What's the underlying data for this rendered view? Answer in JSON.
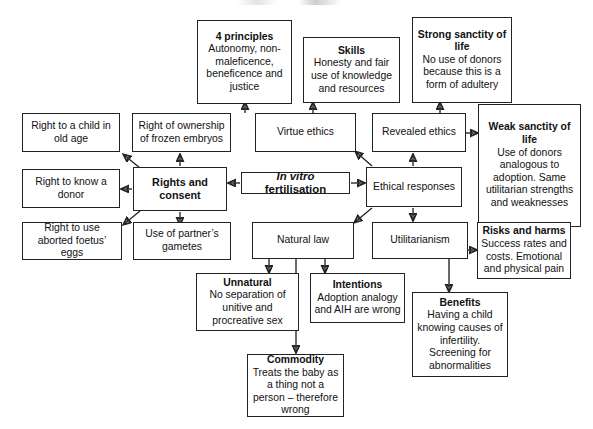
{
  "diagram": {
    "central_node": {
      "lead": "In vitro",
      "rest": " fertilisation"
    },
    "nodes": [
      {
        "id": "four-principles",
        "title": "4 principles",
        "body": "Autonomy, non-maleficence, beneficence and justice"
      },
      {
        "id": "skills",
        "title": "Skills",
        "body": "Honesty and fair use of knowledge and resources"
      },
      {
        "id": "strong-sanctity-of-life",
        "title": "Strong sanctity of life",
        "body": "No use of donors because this is a form of adultery"
      },
      {
        "id": "weak-sanctity-of-life",
        "title": "Weak sanctity of life",
        "body": "Use of donors analogous to adoption. Same utilitarian strengths and weaknesses"
      },
      {
        "id": "right-to-a-child-in-old-age",
        "title": "",
        "body": "Right to a child in old age"
      },
      {
        "id": "right-of-ownership-of-frozen-embryos",
        "title": "",
        "body": "Right of ownership of frozen embryos"
      },
      {
        "id": "virtue-ethics",
        "title": "",
        "body": "Virtue ethics"
      },
      {
        "id": "revealed-ethics",
        "title": "",
        "body": "Revealed ethics"
      },
      {
        "id": "right-to-know-a-donor",
        "title": "",
        "body": "Right to know a donor"
      },
      {
        "id": "rights-and-consent",
        "title": "Rights and consent",
        "body": ""
      },
      {
        "id": "ethical-responses",
        "title": "",
        "body": "Ethical responses"
      },
      {
        "id": "right-to-use-aborted-foetus-eggs",
        "title": "",
        "body": "Right to use aborted foetus’ eggs"
      },
      {
        "id": "use-of-partners-gametes",
        "title": "",
        "body": "Use of partner’s gametes"
      },
      {
        "id": "natural-law",
        "title": "",
        "body": "Natural law"
      },
      {
        "id": "utilitarianism",
        "title": "",
        "body": "Utilitarianism"
      },
      {
        "id": "risks-and-harms",
        "title": "Risks and harms",
        "body": "Success rates and costs. Emotional and physical pain"
      },
      {
        "id": "unnatural",
        "title": "Unnatural",
        "body": "No separation of unitive and procreative sex"
      },
      {
        "id": "intentions",
        "title": "Intentions",
        "body": "Adoption analogy and AIH are wrong"
      },
      {
        "id": "benefits",
        "title": "Benefits",
        "body": "Having a child knowing causes of infertility. Screening for abnormalities"
      },
      {
        "id": "commodity",
        "title": "Commodity",
        "body": "Treats the baby as a thing not a person – therefore wrong"
      }
    ],
    "colors": {
      "stroke": "#232323",
      "text": "#111111",
      "background": "#ffffff"
    }
  }
}
